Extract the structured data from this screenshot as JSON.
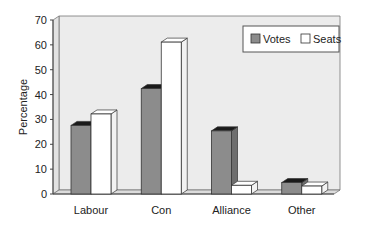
{
  "chart_data": {
    "type": "bar",
    "title": "",
    "xlabel": "",
    "ylabel": "Percentage",
    "ylim": [
      0,
      70
    ],
    "yticks": [
      0,
      10,
      20,
      30,
      40,
      50,
      60,
      70
    ],
    "grid": false,
    "style": "3d-bar",
    "legend_position": "top-right-inside",
    "categories": [
      "Labour",
      "Con",
      "Alliance",
      "Other"
    ],
    "series": [
      {
        "name": "Votes",
        "color": "#8c8c8c",
        "values": [
          27.6,
          42.4,
          25.4,
          4.6
        ]
      },
      {
        "name": "Seats",
        "color": "#ffffff",
        "values": [
          32.2,
          61.1,
          3.5,
          3.2
        ]
      }
    ]
  },
  "legend": {
    "items": [
      {
        "label": "Votes",
        "color": "#8c8c8c"
      },
      {
        "label": "Seats",
        "color": "#ffffff"
      }
    ]
  },
  "colors": {
    "plot_background": "#ececec",
    "axis": "#555555",
    "bar_top_votes": "#1a1a1a"
  }
}
